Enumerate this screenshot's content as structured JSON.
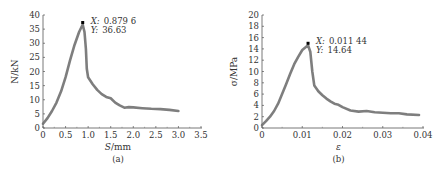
{
  "chart_data": [
    {
      "type": "line",
      "panel_label": "(a)",
      "title": "",
      "xlabel_var": "S",
      "xlabel_unit": "/mm",
      "ylabel": "N/kN",
      "xlim": [
        0,
        3.5
      ],
      "ylim": [
        0,
        40
      ],
      "xticks": [
        "0",
        "0.5",
        "1.0",
        "1.5",
        "2.0",
        "2.5",
        "3.0",
        "3.5"
      ],
      "xtick_values": [
        0,
        0.5,
        1.0,
        1.5,
        2.0,
        2.5,
        3.0,
        3.5
      ],
      "yticks": [
        "0",
        "5",
        "10",
        "15",
        "20",
        "25",
        "30",
        "35",
        "40"
      ],
      "ytick_values": [
        0,
        5,
        10,
        15,
        20,
        25,
        30,
        35,
        40
      ],
      "grid": false,
      "annotation": {
        "x_label": "X:",
        "x_value": "0.879 6",
        "y_label": "Y:",
        "y_value": "36.63",
        "x": 0.8796,
        "y": 36.63
      },
      "series": [
        {
          "name": "load-displacement",
          "color": "#707070",
          "x": [
            0,
            0.1,
            0.2,
            0.3,
            0.4,
            0.5,
            0.6,
            0.7,
            0.8,
            0.8796,
            0.92,
            0.95,
            0.97,
            1.0,
            1.1,
            1.2,
            1.3,
            1.4,
            1.5,
            1.6,
            1.7,
            1.8,
            1.9,
            2.0,
            2.2,
            2.4,
            2.6,
            2.8,
            3.0
          ],
          "y": [
            1.5,
            3.5,
            6,
            9,
            13,
            18,
            24,
            29.5,
            34,
            36.63,
            34,
            28,
            21,
            18,
            15.5,
            13.5,
            12,
            11,
            10.5,
            9,
            8,
            7.2,
            7.4,
            7.3,
            7,
            6.8,
            6.7,
            6.4,
            6
          ]
        }
      ]
    },
    {
      "type": "line",
      "panel_label": "(b)",
      "title": "",
      "xlabel_var": "ε",
      "xlabel_unit": "",
      "ylabel": "σ/MPa",
      "xlim": [
        0,
        0.04
      ],
      "ylim": [
        0,
        20
      ],
      "xticks": [
        "0",
        "0.01",
        "0.02",
        "0.03",
        "0.04"
      ],
      "xtick_values": [
        0,
        0.01,
        0.02,
        0.03,
        0.04
      ],
      "yticks": [
        "0",
        "2",
        "4",
        "6",
        "8",
        "10",
        "12",
        "14",
        "16",
        "18",
        "20"
      ],
      "ytick_values": [
        0,
        2,
        4,
        6,
        8,
        10,
        12,
        14,
        16,
        18,
        20
      ],
      "grid": false,
      "annotation": {
        "x_label": "X:",
        "x_value": "0.011 44",
        "y_label": "Y:",
        "y_value": "14.64",
        "x": 0.01144,
        "y": 14.64
      },
      "series": [
        {
          "name": "stress-strain",
          "color": "#707070",
          "x": [
            0,
            0.001,
            0.002,
            0.003,
            0.004,
            0.005,
            0.006,
            0.007,
            0.008,
            0.009,
            0.01,
            0.01144,
            0.012,
            0.0125,
            0.013,
            0.014,
            0.015,
            0.016,
            0.017,
            0.018,
            0.019,
            0.02,
            0.022,
            0.024,
            0.026,
            0.028,
            0.03,
            0.032,
            0.034,
            0.036,
            0.039
          ],
          "y": [
            0.5,
            1.2,
            2,
            3,
            4.3,
            6,
            7.8,
            9.6,
            11.3,
            12.6,
            13.8,
            14.64,
            13.5,
            10,
            7.5,
            6.5,
            5.8,
            5.2,
            4.7,
            4.3,
            4.1,
            3.7,
            3.1,
            2.9,
            3.0,
            2.8,
            2.7,
            2.6,
            2.6,
            2.4,
            2.3
          ]
        }
      ]
    }
  ]
}
